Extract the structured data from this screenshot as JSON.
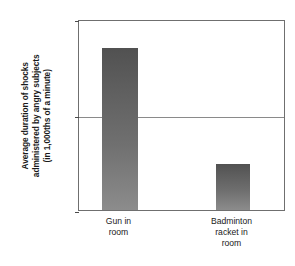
{
  "chart_data": {
    "type": "bar",
    "title": "",
    "xlabel": "",
    "ylabel": "Average duration of shocks administered by angry subjects (in 1,000ths of a minute)",
    "ylabel_lines": [
      "Average duration of shocks",
      "administered by angry subjects",
      "(in 1,000ths of a minute)"
    ],
    "categories": [
      "Gun in room",
      "Badminton racket in room"
    ],
    "category_label_lines": [
      [
        "Gun in",
        "room"
      ],
      [
        "Badminton",
        "racket in",
        "room"
      ]
    ],
    "values": [
      47,
      34.8
    ],
    "ylim": [
      30,
      50
    ],
    "yticks": [
      30,
      40,
      50
    ],
    "ytick_labels": [
      "30",
      "40",
      "50"
    ],
    "grid": true,
    "gridlines_at": [
      40
    ],
    "legend": "none",
    "bar_color": "#6b6b6b",
    "bar_color_top": "#515151",
    "bar_color_bottom": "#8c8c8c",
    "plot_background": "#ffffff",
    "axis_color": "#6f6f6f"
  }
}
